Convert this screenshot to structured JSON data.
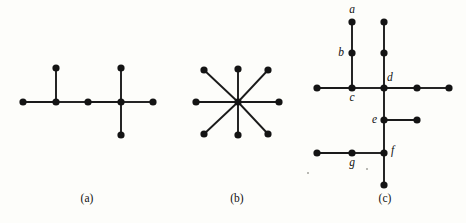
{
  "figure": {
    "background_color": "#fdfdfa",
    "ink_color": "#141414",
    "node_radius": 3.6,
    "edge_width": 1.9,
    "width": 466,
    "height": 223,
    "panels": [
      {
        "id": "a",
        "caption": "(a)",
        "caption_x": 87,
        "caption_y": 202,
        "description": "caterpillar tree with seven vertices",
        "nodes": [
          {
            "id": "a1",
            "x": 23,
            "y": 102,
            "label": ""
          },
          {
            "id": "a2",
            "x": 56,
            "y": 102,
            "label": ""
          },
          {
            "id": "a3",
            "x": 56,
            "y": 68,
            "label": ""
          },
          {
            "id": "a4",
            "x": 88,
            "y": 102,
            "label": ""
          },
          {
            "id": "a5",
            "x": 121,
            "y": 102,
            "label": ""
          },
          {
            "id": "a6",
            "x": 121,
            "y": 68,
            "label": ""
          },
          {
            "id": "a7",
            "x": 121,
            "y": 135,
            "label": ""
          },
          {
            "id": "a8",
            "x": 153,
            "y": 102,
            "label": ""
          }
        ],
        "edges": [
          [
            "a1",
            "a2"
          ],
          [
            "a2",
            "a3"
          ],
          [
            "a2",
            "a4"
          ],
          [
            "a4",
            "a5"
          ],
          [
            "a5",
            "a6"
          ],
          [
            "a5",
            "a7"
          ],
          [
            "a5",
            "a8"
          ]
        ]
      },
      {
        "id": "b",
        "caption": "(b)",
        "caption_x": 237,
        "caption_y": 202,
        "description": "star graph with eight leaves around one center",
        "nodes": [
          {
            "id": "b0",
            "x": 238,
            "y": 102,
            "label": ""
          },
          {
            "id": "b1",
            "x": 238,
            "y": 69,
            "label": ""
          },
          {
            "id": "b2",
            "x": 268,
            "y": 70,
            "label": ""
          },
          {
            "id": "b3",
            "x": 279,
            "y": 102,
            "label": ""
          },
          {
            "id": "b4",
            "x": 268,
            "y": 134,
            "label": ""
          },
          {
            "id": "b5",
            "x": 238,
            "y": 135,
            "label": ""
          },
          {
            "id": "b6",
            "x": 204,
            "y": 134,
            "label": ""
          },
          {
            "id": "b7",
            "x": 196,
            "y": 102,
            "label": ""
          },
          {
            "id": "b8",
            "x": 204,
            "y": 70,
            "label": ""
          }
        ],
        "edges": [
          [
            "b0",
            "b1"
          ],
          [
            "b0",
            "b2"
          ],
          [
            "b0",
            "b3"
          ],
          [
            "b0",
            "b4"
          ],
          [
            "b0",
            "b5"
          ],
          [
            "b0",
            "b6"
          ],
          [
            "b0",
            "b7"
          ],
          [
            "b0",
            "b8"
          ]
        ]
      },
      {
        "id": "c",
        "caption": "(c)",
        "caption_x": 385,
        "caption_y": 202,
        "description": "labeled tree with vertices a through g",
        "nodes": [
          {
            "id": "a",
            "x": 352,
            "y": 22,
            "label": "a",
            "label_dx": 0,
            "label_dy": -9,
            "label_anchor": "middle"
          },
          {
            "id": "b",
            "x": 352,
            "y": 53,
            "label": "b",
            "label_dx": -8,
            "label_dy": 3,
            "label_anchor": "end"
          },
          {
            "id": "c",
            "x": 352,
            "y": 88,
            "label": "c",
            "label_dx": 0,
            "label_dy": 13,
            "label_anchor": "middle"
          },
          {
            "id": "d",
            "x": 384,
            "y": 88,
            "label": "d",
            "label_dx": 3,
            "label_dy": -7,
            "label_anchor": "start"
          },
          {
            "id": "e",
            "x": 384,
            "y": 120,
            "label": "e",
            "label_dx": -7,
            "label_dy": 3,
            "label_anchor": "end"
          },
          {
            "id": "f",
            "x": 384,
            "y": 153,
            "label": "f",
            "label_dx": 7,
            "label_dy": 1,
            "label_anchor": "start"
          },
          {
            "id": "g",
            "x": 352,
            "y": 153,
            "label": "g",
            "label_dx": 0,
            "label_dy": 13,
            "label_anchor": "middle"
          },
          {
            "id": "h",
            "x": 384,
            "y": 22,
            "label": ""
          },
          {
            "id": "i",
            "x": 384,
            "y": 53,
            "label": ""
          },
          {
            "id": "j",
            "x": 317,
            "y": 88,
            "label": ""
          },
          {
            "id": "k",
            "x": 417,
            "y": 88,
            "label": ""
          },
          {
            "id": "l",
            "x": 449,
            "y": 88,
            "label": ""
          },
          {
            "id": "m",
            "x": 417,
            "y": 120,
            "label": ""
          },
          {
            "id": "n",
            "x": 317,
            "y": 153,
            "label": ""
          },
          {
            "id": "o",
            "x": 384,
            "y": 185,
            "label": ""
          }
        ],
        "edges": [
          [
            "a",
            "b"
          ],
          [
            "b",
            "c"
          ],
          [
            "j",
            "c"
          ],
          [
            "c",
            "d"
          ],
          [
            "h",
            "i"
          ],
          [
            "i",
            "d"
          ],
          [
            "d",
            "k"
          ],
          [
            "k",
            "l"
          ],
          [
            "d",
            "e"
          ],
          [
            "e",
            "m"
          ],
          [
            "e",
            "f"
          ],
          [
            "n",
            "g"
          ],
          [
            "g",
            "f"
          ],
          [
            "f",
            "o"
          ]
        ]
      }
    ],
    "specks": [
      {
        "x": 307,
        "y": 172,
        "w": 2,
        "h": 2
      },
      {
        "x": 366,
        "y": 168,
        "w": 2,
        "h": 2
      }
    ]
  }
}
